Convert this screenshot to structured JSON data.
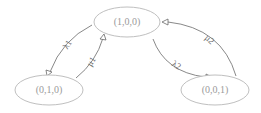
{
  "diagram": {
    "type": "state-transition",
    "colors": {
      "node_stroke": "#b8b8b8",
      "node_text": "#9a9a9a",
      "edge_stroke": "#6a6a6a"
    },
    "nodes": [
      {
        "id": "s100",
        "label": "(1,0,0)"
      },
      {
        "id": "s010",
        "label": "(0,1,0)"
      },
      {
        "id": "s001",
        "label": "(0,0,1)"
      }
    ],
    "edges": [
      {
        "from": "(1,0,0)",
        "to": "(0,1,0)",
        "label": "λ1"
      },
      {
        "from": "(0,1,0)",
        "to": "(1,0,0)",
        "label": "μ1"
      },
      {
        "from": "(1,0,0)",
        "to": "(0,0,1)",
        "label": "λ2"
      },
      {
        "from": "(0,0,1)",
        "to": "(1,0,0)",
        "label": "μ2"
      }
    ]
  }
}
